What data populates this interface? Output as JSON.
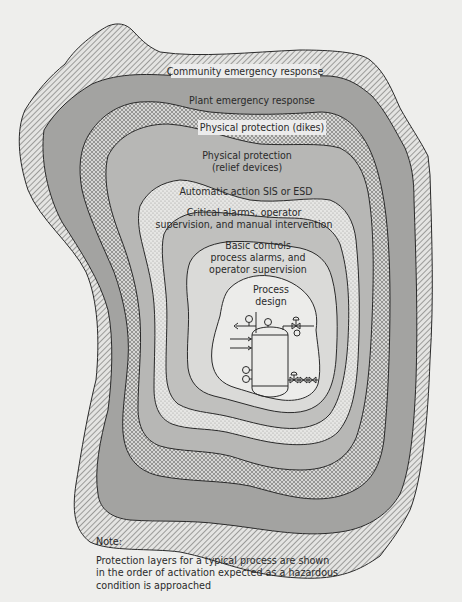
{
  "figure": {
    "title": "Protection layers for a typical process",
    "layers": [
      {
        "order": 1,
        "label": "Process design",
        "lines": [
          "Process",
          "design"
        ],
        "fill": "#e9e9e7",
        "pattern": "solid-lightest"
      },
      {
        "order": 2,
        "label": "Basic controls process alarms, and operator supervision",
        "lines": [
          "Basic controls",
          "process alarms, and",
          "operator supervision"
        ],
        "fill": "#d8d8d6",
        "pattern": "solid-light"
      },
      {
        "order": 3,
        "label": "Critical alarms, operator supervision, and manual intervention",
        "lines": [
          "Critical alarms, operator",
          "supervision, and manual intervention"
        ],
        "fill": "#bdbdbb",
        "pattern": "solid-medium"
      },
      {
        "order": 4,
        "label": "Automatic action SIS or ESD",
        "lines": [
          "Automatic action SIS or ESD"
        ],
        "fill": "#e2e2e0",
        "pattern": "dots"
      },
      {
        "order": 5,
        "label": "Physical protection (relief devices)",
        "lines": [
          "Physical protection",
          "(relief devices)"
        ],
        "fill": "#b5b5b3",
        "pattern": "solid-medium"
      },
      {
        "order": 6,
        "label": "Physical protection (dikes)",
        "lines": [
          "Physical protection (dikes)"
        ],
        "fill": "#d0d0ce",
        "pattern": "crosshatch"
      },
      {
        "order": 7,
        "label": "Plant emergency response",
        "lines": [
          "Plant emergency response"
        ],
        "fill": "#9f9f9d",
        "pattern": "solid-dark"
      },
      {
        "order": 8,
        "label": "Community emergency response",
        "lines": [
          "Community emergency response"
        ],
        "fill": "#d6d6d4",
        "pattern": "diagonal-hatch"
      }
    ],
    "center_icon": "process-vessel-schematic"
  },
  "note": {
    "title": "Note:",
    "text_lines": [
      "Protection layers for a typical process are shown",
      "in the order of activation expected as a hazardous",
      "condition is approached"
    ]
  },
  "colors": {
    "background": "#eeeeec",
    "outline": "#2a2a2a",
    "text": "#2a2a2a"
  }
}
